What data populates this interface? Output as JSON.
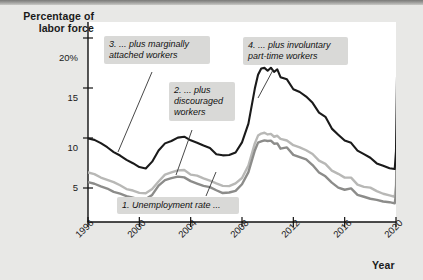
{
  "figure": {
    "y_axis_title": "Percentage of\nlabor force",
    "x_axis_title": "Year"
  },
  "chart_data": {
    "type": "line",
    "title": "",
    "xlabel": "Year",
    "ylabel": "Percentage of labor force",
    "xlim": [
      1996,
      2020
    ],
    "ylim": [
      0,
      22
    ],
    "grid": false,
    "legend": "none",
    "y_ticks": [
      "20%",
      "15",
      "10",
      "5"
    ],
    "y_tick_values": [
      20,
      15,
      10,
      5
    ],
    "x_ticks": [
      "1996",
      "2000",
      "2004",
      "2008",
      "2012",
      "2016",
      "2020"
    ],
    "x_tick_values": [
      1996,
      2000,
      2004,
      2008,
      2012,
      2016,
      2020
    ],
    "annotations": [
      {
        "id": "callout-1",
        "text": "1. Unemployment rate ...",
        "target_series": "unemployment-rate"
      },
      {
        "id": "callout-2",
        "text": "2. ... plus\ndiscouraged\nworkers",
        "target_series": "plus-discouraged-workers"
      },
      {
        "id": "callout-3",
        "text": "3. ... plus marginally\nattached workers",
        "target_series": "plus-marginally-attached-workers"
      },
      {
        "id": "callout-4",
        "text": "4. ... plus involuntary\npart-time workers",
        "target_series": "plus-involuntary-part-time-workers"
      }
    ],
    "x": [
      1996.0,
      1996.5,
      1997.0,
      1997.5,
      1998.0,
      1998.5,
      1999.0,
      1999.5,
      2000.0,
      2000.5,
      2001.0,
      2001.5,
      2002.0,
      2002.5,
      2003.0,
      2003.5,
      2004.0,
      2004.5,
      2005.0,
      2005.5,
      2006.0,
      2006.5,
      2007.0,
      2007.5,
      2008.0,
      2008.5,
      2009.0,
      2009.25,
      2009.5,
      2009.75,
      2010.0,
      2010.25,
      2010.5,
      2010.75,
      2011.0,
      2011.5,
      2012.0,
      2012.5,
      2013.0,
      2013.5,
      2014.0,
      2014.5,
      2015.0,
      2015.5,
      2016.0,
      2016.5,
      2017.0,
      2017.5,
      2018.0,
      2018.5,
      2019.0,
      2019.5,
      2019.9,
      2020.0,
      2020.15,
      2020.3
    ],
    "series": [
      {
        "name": "plus-involuntary-part-time-workers",
        "label": "4. ... plus involuntary part-time workers",
        "color": "#1a1a1a",
        "width": 2.1,
        "values": [
          10.0,
          9.8,
          9.4,
          9.0,
          8.6,
          8.2,
          7.8,
          7.4,
          7.1,
          7.0,
          7.6,
          8.7,
          9.5,
          9.7,
          10.1,
          10.2,
          9.8,
          9.6,
          9.2,
          9.0,
          8.4,
          8.2,
          8.3,
          8.6,
          9.6,
          11.5,
          15.0,
          16.4,
          16.9,
          17.1,
          16.8,
          17.1,
          16.6,
          16.9,
          16.1,
          15.9,
          14.9,
          14.6,
          14.2,
          13.6,
          12.6,
          12.1,
          11.0,
          10.3,
          9.8,
          9.6,
          8.7,
          8.4,
          8.1,
          7.5,
          7.3,
          7.0,
          6.9,
          8.7,
          22.8,
          22.9
        ]
      },
      {
        "name": "plus-marginally-attached-workers",
        "label": "3. ... plus marginally attached workers",
        "color": "#b8b8b6",
        "width": 2.4,
        "values": [
          6.6,
          6.4,
          6.1,
          5.8,
          5.5,
          5.2,
          4.9,
          4.7,
          4.5,
          4.4,
          4.9,
          5.7,
          6.3,
          6.5,
          6.8,
          6.8,
          6.4,
          6.3,
          6.0,
          5.8,
          5.4,
          5.2,
          5.2,
          5.4,
          6.0,
          7.3,
          9.5,
          10.3,
          10.5,
          10.6,
          10.3,
          10.5,
          10.2,
          10.3,
          9.9,
          9.8,
          9.3,
          9.1,
          8.8,
          8.4,
          7.8,
          7.5,
          6.8,
          6.4,
          6.1,
          6.0,
          5.4,
          5.2,
          5.0,
          4.7,
          4.5,
          4.3,
          4.2,
          5.2,
          15.0,
          15.1
        ]
      },
      {
        "name": "unemployment-rate",
        "label": "1. Unemployment rate ...",
        "color": "#8c8c8a",
        "width": 2.4,
        "values": [
          5.6,
          5.4,
          5.2,
          4.9,
          4.6,
          4.4,
          4.2,
          4.1,
          3.9,
          3.9,
          4.4,
          5.3,
          5.8,
          5.9,
          6.1,
          6.1,
          5.7,
          5.5,
          5.2,
          5.0,
          4.7,
          4.5,
          4.5,
          4.7,
          5.3,
          6.6,
          8.8,
          9.5,
          9.6,
          9.8,
          9.7,
          9.8,
          9.5,
          9.5,
          9.0,
          9.0,
          8.3,
          8.1,
          7.8,
          7.3,
          6.6,
          6.2,
          5.6,
          5.1,
          4.9,
          4.9,
          4.4,
          4.2,
          4.0,
          3.8,
          3.7,
          3.6,
          3.5,
          4.4,
          14.7,
          14.8
        ]
      }
    ]
  },
  "axis_ticks": {
    "y": [
      {
        "label": "20%",
        "value": 20
      },
      {
        "label": "15",
        "value": 15
      },
      {
        "label": "10",
        "value": 10
      },
      {
        "label": "5",
        "value": 5
      }
    ],
    "x": [
      {
        "label": "1996",
        "value": 1996
      },
      {
        "label": "2000",
        "value": 2000
      },
      {
        "label": "2004",
        "value": 2004
      },
      {
        "label": "2008",
        "value": 2008
      },
      {
        "label": "2012",
        "value": 2012
      },
      {
        "label": "2016",
        "value": 2016
      },
      {
        "label": "2020",
        "value": 2020
      }
    ]
  },
  "callouts": [
    {
      "name": "callout-marginally-attached",
      "text": "3. ... plus marginally\nattached workers"
    },
    {
      "name": "callout-discouraged",
      "text": "2. ... plus\ndiscouraged\nworkers"
    },
    {
      "name": "callout-involuntary-part-time",
      "text": "4. ... plus involuntary\npart-time workers"
    },
    {
      "name": "callout-unemployment-rate",
      "text": "1. Unemployment rate ..."
    }
  ]
}
